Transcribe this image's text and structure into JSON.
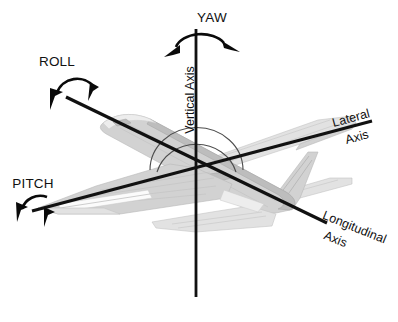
{
  "diagram": {
    "background_color": "#ffffff",
    "line_color": "#111111",
    "aircraft_fill_color": "#d2d2d2",
    "axes": [
      {
        "id": "vertical",
        "label_line1": "Vertical Axis",
        "label_line2": "",
        "rotation_name": "YAW",
        "orientation_deg": 90,
        "x1": 196,
        "y1": 29,
        "x2": 196,
        "y2": 297
      },
      {
        "id": "lateral",
        "label_line1": "Lateral",
        "label_line2": "Axis",
        "rotation_name": "PITCH",
        "orientation_deg": -17,
        "x1": 32,
        "y1": 211,
        "x2": 372,
        "y2": 121
      },
      {
        "id": "longitudinal",
        "label_line1": "Longitudinal",
        "label_line2": "Axis",
        "rotation_name": "ROLL",
        "orientation_deg": 22,
        "x1": 66,
        "y1": 97,
        "x2": 327,
        "y2": 223
      }
    ],
    "rotation_labels": [
      {
        "id": "yaw",
        "text": "YAW",
        "x": 212,
        "y": 22,
        "anchor": "middle"
      },
      {
        "id": "roll",
        "text": "ROLL",
        "x": 57,
        "y": 66,
        "anchor": "middle"
      },
      {
        "id": "pitch",
        "text": "PITCH",
        "x": 33,
        "y": 188,
        "anchor": "middle"
      }
    ],
    "axis_labels": [
      {
        "id": "vertical-axis-label",
        "text": "Vertical Axis",
        "x": 192,
        "y": 134,
        "rotate": -90
      },
      {
        "id": "lateral-axis-label-1",
        "text": "Lateral",
        "x": 330,
        "y": 121,
        "rotate": -15
      },
      {
        "id": "lateral-axis-label-2",
        "text": "Axis",
        "x": 345,
        "y": 140,
        "rotate": -15
      },
      {
        "id": "longitudinal-axis-label-1",
        "text": "Longitudinal",
        "x": 313,
        "y": 230,
        "rotate": 22
      },
      {
        "id": "longitudinal-axis-label-2",
        "text": "Axis",
        "x": 312,
        "y": 248,
        "rotate": 22
      }
    ]
  }
}
